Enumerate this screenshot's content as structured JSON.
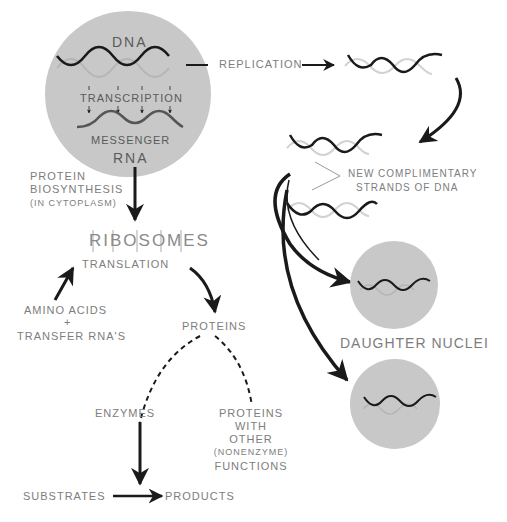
{
  "diagram": {
    "nucleus": {
      "dna_label": "DNA",
      "transcription_label": "TRANSCRIPTION",
      "messenger_label": "MESSENGER",
      "rna_label": "RNA"
    },
    "replication": {
      "label": "REPLICATION",
      "new_strands_line1": "NEW COMPLIMENTARY",
      "new_strands_line2": "STRANDS OF DNA",
      "daughter_nuclei_label": "DAUGHTER NUCLEI"
    },
    "protein_synthesis": {
      "title_line1": "PROTEIN",
      "title_line2": "BIOSYNTHESIS",
      "title_line3": "(IN CYTOPLASM)",
      "ribosomes_label": "RIBOSOMES",
      "translation_label": "TRANSLATION",
      "amino_acids_label": "AMINO ACIDS",
      "plus_label": "+",
      "transfer_rna_label": "TRANSFER RNA'S",
      "proteins_label": "PROTEINS",
      "enzymes_label": "ENZYMES",
      "other_proteins_line1": "PROTEINS",
      "other_proteins_line2": "WITH",
      "other_proteins_line3": "OTHER",
      "other_proteins_line4": "(NONENZYME)",
      "other_proteins_line5": "FUNCTIONS",
      "substrates_label": "SUBSTRATES",
      "products_label": "PRODUCTS"
    },
    "colors": {
      "circle_fill": "#c8c8c8",
      "strand_dark": "#1a1a1a",
      "strand_light": "#cfcfcf",
      "text": "#7d7d7d"
    }
  }
}
